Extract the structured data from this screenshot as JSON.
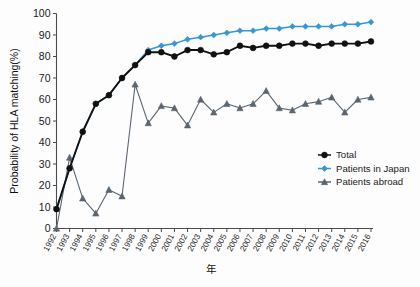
{
  "chart_data": {
    "type": "line",
    "title": "",
    "xlabel": "年",
    "ylabel": "Probability of HLA matching(%)",
    "ylim": [
      0,
      100
    ],
    "yticks": [
      0,
      10,
      20,
      30,
      40,
      50,
      60,
      70,
      80,
      90,
      100
    ],
    "grid": false,
    "legend_position": "right-middle",
    "categories": [
      "1992",
      "1993",
      "1994",
      "1995",
      "1996",
      "1997",
      "1998",
      "1999",
      "2000",
      "2001",
      "2002",
      "2003",
      "2004",
      "2005",
      "2006",
      "2007",
      "2008",
      "2009",
      "2010",
      "2011",
      "2012",
      "2013",
      "2014",
      "2015",
      "2016"
    ],
    "x": [
      1992,
      1993,
      1994,
      1995,
      1996,
      1997,
      1998,
      1999,
      2000,
      2001,
      2002,
      2003,
      2004,
      2005,
      2006,
      2007,
      2008,
      2009,
      2010,
      2011,
      2012,
      2013,
      2014,
      2015,
      2016
    ],
    "series": [
      {
        "name": "Total",
        "color": "#111111",
        "marker": "circle",
        "values": [
          9,
          28,
          45,
          58,
          62,
          70,
          76,
          82,
          82,
          80,
          83,
          83,
          81,
          82,
          85,
          84,
          85,
          85,
          86,
          86,
          85,
          86,
          86,
          86,
          87
        ]
      },
      {
        "name": "Patients in Japan",
        "color": "#3796d4",
        "marker": "diamond",
        "values": [
          9,
          28,
          45,
          58,
          62,
          70,
          76,
          83,
          85,
          86,
          88,
          89,
          90,
          91,
          92,
          92,
          93,
          93,
          94,
          94,
          94,
          94,
          95,
          95,
          96
        ]
      },
      {
        "name": "Patients abroad",
        "color": "#5b6570",
        "marker": "triangle",
        "values": [
          0,
          33,
          14,
          7,
          18,
          15,
          67,
          49,
          57,
          56,
          48,
          60,
          54,
          58,
          56,
          58,
          64,
          56,
          55,
          58,
          59,
          61,
          54,
          60,
          61
        ]
      }
    ]
  },
  "legend": {
    "items": [
      {
        "label": "Total"
      },
      {
        "label": "Patients in Japan"
      },
      {
        "label": "Patients abroad"
      }
    ]
  }
}
